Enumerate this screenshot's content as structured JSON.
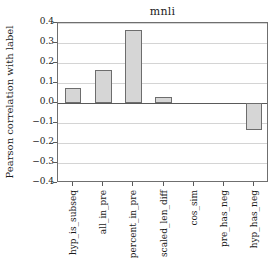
{
  "chart_data": {
    "type": "bar",
    "title": "mnli",
    "xlabel": "",
    "ylabel": "Pearson correlation with label",
    "ylim": [
      -0.4,
      0.4
    ],
    "yticks": [
      0.4,
      0.3,
      0.2,
      0.1,
      0.0,
      -0.1,
      -0.2,
      -0.3,
      -0.4
    ],
    "ytick_labels": [
      "0.4",
      "0.3",
      "0.2",
      "0.1",
      "0.0",
      "−0.1",
      "−0.2",
      "−0.3",
      "−0.4"
    ],
    "grid": true,
    "legend": "none",
    "categories": [
      "hyp_is_subseq",
      "all_in_pre",
      "percent_in_pre",
      "scaled_len_diff",
      "cos_sim",
      "pre_has_neg",
      "hyp_has_neg"
    ],
    "values": [
      0.074,
      0.164,
      0.364,
      0.031,
      0.0,
      0.0,
      -0.135
    ],
    "bar_fill_color": "#d6d6d6",
    "bar_edge_color": "#6d6d6d",
    "axis_color": "#6f6f6f",
    "grid_color": "#d4d4d4"
  }
}
